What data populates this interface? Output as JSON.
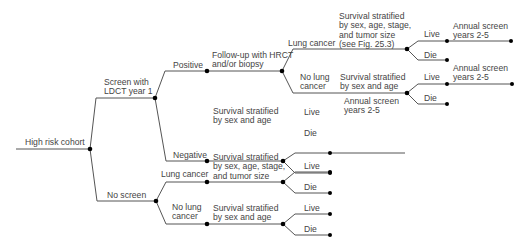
{
  "diagram": {
    "type": "decision-tree",
    "root": "High risk cohort",
    "labels": {
      "root": "High risk cohort",
      "screen": "Screen with\nLDCT year 1",
      "no_screen": "No screen",
      "positive": "Positive",
      "negative": "Negative",
      "followup": "Follow-up with HRCT\nand/or biopsy",
      "lung_cancer_1": "Lung cancer",
      "no_lung_cancer_1": "No lung\ncancer",
      "surv_full_1": "Survival stratified\nby sex, age, stage,\nand tumor size\n(see Fig. 25.3)",
      "surv_sexage_1": "Survival stratified\nby sex and age",
      "surv_sexage_neg": "Survival stratified\nby sex and age",
      "lung_cancer_2": "Lung cancer",
      "no_lung_cancer_2": "No lung\ncancer",
      "surv_full_2": "Survival stratified\nby sex, age, stage,\nand tumor size",
      "surv_sexage_2": "Survival stratified\nby sex and age",
      "live": "Live",
      "die": "Die",
      "annual_screen": "Annual screen\nyears 2-5"
    },
    "line_color": "#555555",
    "node_color": "#000000"
  }
}
